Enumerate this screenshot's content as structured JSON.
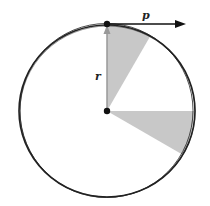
{
  "diagram": {
    "center": {
      "x": 107,
      "y": 111
    },
    "radius": 87,
    "circle_color": "#222222",
    "sector_color": "#c8c8c8",
    "vectors": [
      {
        "name": "r",
        "label": "r",
        "color": "#999999"
      },
      {
        "name": "p",
        "label": "p",
        "color": "#111111"
      }
    ],
    "sectors": [
      {
        "from_deg": 60,
        "to_deg": 90
      },
      {
        "from_deg": -30,
        "to_deg": 0
      }
    ]
  }
}
